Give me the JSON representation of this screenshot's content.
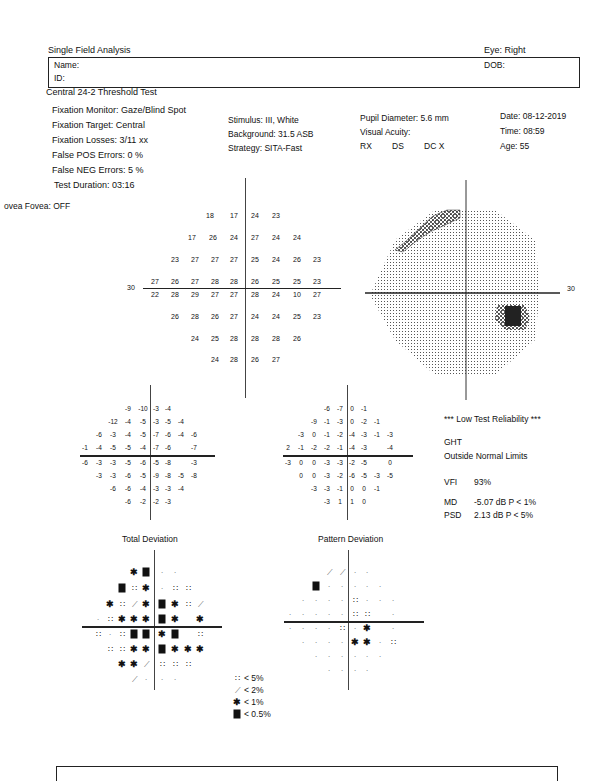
{
  "header": {
    "title": "Single Field Analysis",
    "eye": "Eye: Right",
    "name_label": "Name:",
    "id_label": "ID:",
    "dob_label": "DOB:",
    "test_name": "Central 24-2 Threshold Test"
  },
  "params": {
    "fixation_monitor": "Fixation Monitor: Gaze/Blind Spot",
    "fixation_target": "Fixation Target: Central",
    "fixation_losses": "Fixation Losses: 3/11 xx",
    "false_pos": "False POS Errors:  0 %",
    "false_neg": "False NEG Errors:  5 %",
    "test_duration": "Test Duration: 03:16",
    "fovea": "ovea Fovea: OFF",
    "stimulus": "Stimulus: III, White",
    "background": "Background: 31.5 ASB",
    "strategy": "Strategy: SITA-Fast",
    "pupil": "Pupil Diameter: 5.6 mm",
    "acuity": "Visual Acuity:",
    "rx": "RX",
    "ds": "DS",
    "dc": "DC  X",
    "date": "Date: 08-12-2019",
    "time": "Time: 08:59",
    "age": "Age: 55"
  },
  "threshold_plot": {
    "axis_label_left": "30",
    "rows": [
      {
        "y": 216,
        "cells": [
          [
            "18",
            210
          ],
          [
            "17",
            234
          ],
          [
            "24",
            255
          ],
          [
            "23",
            276
          ]
        ]
      },
      {
        "y": 238,
        "cells": [
          [
            "17",
            192
          ],
          [
            "26",
            213
          ],
          [
            "24",
            234
          ],
          [
            "27",
            255
          ],
          [
            "24",
            276
          ],
          [
            "24",
            297
          ]
        ]
      },
      {
        "y": 260,
        "cells": [
          [
            "23",
            175
          ],
          [
            "27",
            195
          ],
          [
            "27",
            215
          ],
          [
            "27",
            234
          ],
          [
            "25",
            255
          ],
          [
            "24",
            276
          ],
          [
            "26",
            297
          ],
          [
            "23",
            317
          ]
        ]
      },
      {
        "y": 282,
        "cells": [
          [
            "27",
            155
          ],
          [
            "26",
            175
          ],
          [
            "27",
            195
          ],
          [
            "28",
            215
          ],
          [
            "28",
            234
          ],
          [
            "26",
            255
          ],
          [
            "25",
            276
          ],
          [
            "25",
            297
          ],
          [
            "23",
            317
          ]
        ]
      },
      {
        "y": 295,
        "cells": [
          [
            "22",
            155
          ],
          [
            "28",
            175
          ],
          [
            "29",
            195
          ],
          [
            "27",
            215
          ],
          [
            "27",
            234
          ],
          [
            "28",
            255
          ],
          [
            "24",
            276
          ],
          [
            "10",
            297
          ],
          [
            "27",
            317
          ]
        ]
      },
      {
        "y": 317,
        "cells": [
          [
            "26",
            175
          ],
          [
            "28",
            195
          ],
          [
            "26",
            215
          ],
          [
            "27",
            234
          ],
          [
            "24",
            255
          ],
          [
            "24",
            276
          ],
          [
            "25",
            297
          ],
          [
            "23",
            317
          ]
        ]
      },
      {
        "y": 339,
        "cells": [
          [
            "24",
            195
          ],
          [
            "25",
            215
          ],
          [
            "28",
            234
          ],
          [
            "28",
            255
          ],
          [
            "28",
            276
          ],
          [
            "26",
            297
          ]
        ]
      },
      {
        "y": 360,
        "cells": [
          [
            "24",
            215
          ],
          [
            "28",
            234
          ],
          [
            "26",
            255
          ],
          [
            "27",
            276
          ]
        ]
      }
    ]
  },
  "total_deviation_values": {
    "rows": [
      {
        "y": 408,
        "cells": [
          [
            "-9",
            128
          ],
          [
            "-10",
            143
          ],
          [
            "-3",
            156
          ],
          [
            "-4",
            168
          ]
        ]
      },
      {
        "y": 421,
        "cells": [
          [
            "-12",
            113
          ],
          [
            "-4",
            128
          ],
          [
            "-5",
            143
          ],
          [
            "-3",
            156
          ],
          [
            "-5",
            168
          ],
          [
            "-4",
            181
          ]
        ]
      },
      {
        "y": 434,
        "cells": [
          [
            "-6",
            99
          ],
          [
            "-3",
            113
          ],
          [
            "-4",
            128
          ],
          [
            "-5",
            143
          ],
          [
            "-7",
            156
          ],
          [
            "-6",
            168
          ],
          [
            "-4",
            181
          ],
          [
            "-6",
            194
          ]
        ]
      },
      {
        "y": 447,
        "cells": [
          [
            "-1",
            85
          ],
          [
            "-4",
            99
          ],
          [
            "-5",
            113
          ],
          [
            "-5",
            128
          ],
          [
            "-4",
            143
          ],
          [
            "-7",
            156
          ],
          [
            "-6",
            168
          ],
          [
            "-7",
            194
          ]
        ]
      },
      {
        "y": 462,
        "cells": [
          [
            "-6",
            85
          ],
          [
            "-3",
            99
          ],
          [
            "-3",
            113
          ],
          [
            "-5",
            128
          ],
          [
            "-6",
            143
          ],
          [
            "-5",
            156
          ],
          [
            "-8",
            168
          ],
          [
            "-3",
            194
          ]
        ]
      },
      {
        "y": 475,
        "cells": [
          [
            "-3",
            99
          ],
          [
            "-3",
            113
          ],
          [
            "-6",
            128
          ],
          [
            "-5",
            143
          ],
          [
            "-9",
            156
          ],
          [
            "-8",
            168
          ],
          [
            "-5",
            181
          ],
          [
            "-8",
            194
          ]
        ]
      },
      {
        "y": 488,
        "cells": [
          [
            "-6",
            113
          ],
          [
            "-6",
            128
          ],
          [
            "-4",
            143
          ],
          [
            "-3",
            156
          ],
          [
            "-3",
            168
          ],
          [
            "-4",
            181
          ]
        ]
      },
      {
        "y": 501,
        "cells": [
          [
            "-6",
            128
          ],
          [
            "-2",
            143
          ],
          [
            "-2",
            156
          ],
          [
            "-3",
            168
          ]
        ]
      }
    ],
    "label": "Total Deviation"
  },
  "pattern_deviation_values": {
    "rows": [
      {
        "y": 408,
        "cells": [
          [
            "-6",
            327
          ],
          [
            "-7",
            340
          ],
          [
            "0",
            352
          ],
          [
            "-1",
            364
          ]
        ]
      },
      {
        "y": 421,
        "cells": [
          [
            "-9",
            314
          ],
          [
            "-1",
            327
          ],
          [
            "-3",
            340
          ],
          [
            "0",
            352
          ],
          [
            "-2",
            364
          ],
          [
            "-1",
            377
          ]
        ]
      },
      {
        "y": 434,
        "cells": [
          [
            "-3",
            301
          ],
          [
            "0",
            314
          ],
          [
            "-1",
            327
          ],
          [
            "-2",
            340
          ],
          [
            "-4",
            352
          ],
          [
            "-3",
            364
          ],
          [
            "-1",
            377
          ],
          [
            "-3",
            390
          ]
        ]
      },
      {
        "y": 447,
        "cells": [
          [
            "2",
            288
          ],
          [
            "-1",
            301
          ],
          [
            "-2",
            314
          ],
          [
            "-2",
            327
          ],
          [
            "-1",
            340
          ],
          [
            "-4",
            352
          ],
          [
            "-3",
            364
          ],
          [
            "-4",
            390
          ]
        ]
      },
      {
        "y": 462,
        "cells": [
          [
            "-3",
            288
          ],
          [
            "0",
            301
          ],
          [
            "0",
            314
          ],
          [
            "-3",
            327
          ],
          [
            "-3",
            340
          ],
          [
            "-2",
            352
          ],
          [
            "-5",
            364
          ],
          [
            "0",
            390
          ]
        ]
      },
      {
        "y": 475,
        "cells": [
          [
            "0",
            301
          ],
          [
            "0",
            314
          ],
          [
            "-3",
            327
          ],
          [
            "-2",
            340
          ],
          [
            "-6",
            352
          ],
          [
            "-5",
            364
          ],
          [
            "-3",
            377
          ],
          [
            "-5",
            390
          ]
        ]
      },
      {
        "y": 488,
        "cells": [
          [
            "-3",
            314
          ],
          [
            "-3",
            327
          ],
          [
            "-1",
            340
          ],
          [
            "0",
            352
          ],
          [
            "0",
            364
          ],
          [
            "-1",
            377
          ]
        ]
      },
      {
        "y": 501,
        "cells": [
          [
            "-3",
            327
          ],
          [
            "1",
            340
          ],
          [
            "1",
            352
          ],
          [
            "0",
            364
          ]
        ]
      }
    ],
    "label": "Pattern Deviation"
  },
  "indices": {
    "reliability": "*** Low Test Reliability ***",
    "ght_label": "GHT",
    "ght_value": "Outside Normal Limits",
    "vfi_label": "VFI",
    "vfi_value": "93%",
    "md_label": "MD",
    "md_value": "-5.07 dB  P < 1%",
    "psd_label": "PSD",
    "psd_value": "2.13 dB  P < 5%"
  },
  "total_deviation_prob": {
    "rows": [
      {
        "y": 572,
        "cells": [
          [
            "x",
            134
          ],
          [
            "b",
            146
          ],
          [
            "p",
            162
          ],
          [
            "p",
            175
          ]
        ]
      },
      {
        "y": 588,
        "cells": [
          [
            "b",
            122
          ],
          [
            "s",
            134
          ],
          [
            "x",
            146
          ],
          [
            "p",
            162
          ],
          [
            "s",
            175
          ],
          [
            "s",
            188
          ]
        ]
      },
      {
        "y": 604,
        "cells": [
          [
            "x",
            110
          ],
          [
            "s",
            122
          ],
          [
            "d",
            134
          ],
          [
            "x",
            146
          ],
          [
            "b",
            162
          ],
          [
            "x",
            175
          ],
          [
            "s",
            188
          ],
          [
            "d",
            200
          ]
        ]
      },
      {
        "y": 619,
        "cells": [
          [
            "p",
            98
          ],
          [
            "s",
            110
          ],
          [
            "x",
            122
          ],
          [
            "x",
            134
          ],
          [
            "x",
            146
          ],
          [
            "b",
            162
          ],
          [
            "x",
            175
          ],
          [
            "x",
            200
          ]
        ]
      },
      {
        "y": 634,
        "cells": [
          [
            "s",
            98
          ],
          [
            "p",
            110
          ],
          [
            "s",
            122
          ],
          [
            "b",
            134
          ],
          [
            "b",
            146
          ],
          [
            "x",
            162
          ],
          [
            "b",
            175
          ],
          [
            "s",
            200
          ]
        ]
      },
      {
        "y": 649,
        "cells": [
          [
            "s",
            110
          ],
          [
            "s",
            122
          ],
          [
            "x",
            134
          ],
          [
            "x",
            146
          ],
          [
            "b",
            162
          ],
          [
            "x",
            175
          ],
          [
            "x",
            188
          ],
          [
            "x",
            200
          ]
        ]
      },
      {
        "y": 664,
        "cells": [
          [
            "x",
            122
          ],
          [
            "x",
            134
          ],
          [
            "d",
            146
          ],
          [
            "s",
            162
          ],
          [
            "s",
            175
          ],
          [
            "s",
            188
          ]
        ]
      },
      {
        "y": 679,
        "cells": [
          [
            "d",
            134
          ],
          [
            "p",
            146
          ],
          [
            "p",
            162
          ],
          [
            "p",
            175
          ]
        ]
      }
    ]
  },
  "pattern_deviation_prob": {
    "rows": [
      {
        "y": 572,
        "cells": [
          [
            "d",
            329
          ],
          [
            "d",
            342
          ],
          [
            "p",
            355
          ],
          [
            "p",
            367
          ]
        ]
      },
      {
        "y": 586,
        "cells": [
          [
            "b",
            316
          ],
          [
            "p",
            329
          ],
          [
            "p",
            342
          ],
          [
            "p",
            355
          ],
          [
            "p",
            367
          ],
          [
            "p",
            380
          ]
        ]
      },
      {
        "y": 600,
        "cells": [
          [
            "p",
            303
          ],
          [
            "p",
            316
          ],
          [
            "p",
            329
          ],
          [
            "p",
            342
          ],
          [
            "s",
            355
          ],
          [
            "p",
            367
          ],
          [
            "p",
            380
          ],
          [
            "p",
            393
          ]
        ]
      },
      {
        "y": 614,
        "cells": [
          [
            "p",
            290
          ],
          [
            "p",
            303
          ],
          [
            "p",
            316
          ],
          [
            "p",
            329
          ],
          [
            "p",
            342
          ],
          [
            "s",
            355
          ],
          [
            "s",
            367
          ],
          [
            "p",
            393
          ]
        ]
      },
      {
        "y": 628,
        "cells": [
          [
            "p",
            290
          ],
          [
            "p",
            303
          ],
          [
            "p",
            316
          ],
          [
            "p",
            329
          ],
          [
            "s",
            342
          ],
          [
            "p",
            355
          ],
          [
            "x",
            367
          ],
          [
            "p",
            393
          ]
        ]
      },
      {
        "y": 642,
        "cells": [
          [
            "p",
            303
          ],
          [
            "p",
            316
          ],
          [
            "p",
            329
          ],
          [
            "p",
            342
          ],
          [
            "x",
            355
          ],
          [
            "x",
            367
          ],
          [
            "p",
            380
          ],
          [
            "s",
            393
          ]
        ]
      },
      {
        "y": 656,
        "cells": [
          [
            "p",
            316
          ],
          [
            "p",
            329
          ],
          [
            "p",
            342
          ],
          [
            "p",
            355
          ],
          [
            "p",
            367
          ],
          [
            "p",
            380
          ]
        ]
      },
      {
        "y": 670,
        "cells": [
          [
            "p",
            329
          ],
          [
            "p",
            342
          ],
          [
            "p",
            355
          ],
          [
            "p",
            367
          ]
        ]
      }
    ]
  },
  "legend": [
    {
      "sym": "s",
      "label": "< 5%"
    },
    {
      "sym": "d",
      "label": "< 2%"
    },
    {
      "sym": "x",
      "label": "< 1%"
    },
    {
      "sym": "b",
      "label": "< 0.5%"
    }
  ],
  "grayscale": {
    "axis_label_right": "30"
  },
  "symbols": {
    "s": "∷",
    "d": "⟋",
    "x": "✱",
    "p": "·"
  }
}
